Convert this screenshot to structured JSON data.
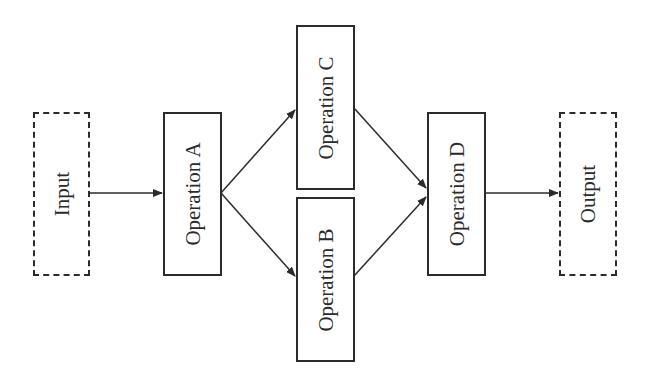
{
  "diagram": {
    "nodes": [
      {
        "id": "input",
        "label": "Input",
        "style": "dashed"
      },
      {
        "id": "op_a",
        "label": "Operation A",
        "style": "solid"
      },
      {
        "id": "op_c",
        "label": "Operation C",
        "style": "solid"
      },
      {
        "id": "op_b",
        "label": "Operation B",
        "style": "solid"
      },
      {
        "id": "op_d",
        "label": "Operation D",
        "style": "solid"
      },
      {
        "id": "output",
        "label": "Output",
        "style": "dashed"
      }
    ],
    "edges": [
      {
        "from": "input",
        "to": "op_a"
      },
      {
        "from": "op_a",
        "to": "op_c"
      },
      {
        "from": "op_a",
        "to": "op_b"
      },
      {
        "from": "op_c",
        "to": "op_d"
      },
      {
        "from": "op_b",
        "to": "op_d"
      },
      {
        "from": "op_d",
        "to": "output"
      }
    ],
    "colors": {
      "stroke": "#2b2b2b",
      "background": "#ffffff"
    }
  }
}
